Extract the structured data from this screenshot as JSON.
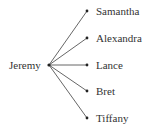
{
  "diagram": {
    "type": "tree",
    "root": {
      "label": "Jeremy",
      "x": 49,
      "y": 65
    },
    "children": [
      {
        "label": "Samantha",
        "x": 87,
        "y": 11
      },
      {
        "label": "Alexandra",
        "x": 87,
        "y": 38
      },
      {
        "label": "Lance",
        "x": 87,
        "y": 65
      },
      {
        "label": "Bret",
        "x": 87,
        "y": 91
      },
      {
        "label": "Tiffany",
        "x": 87,
        "y": 118
      }
    ],
    "line_color": "#555555"
  }
}
